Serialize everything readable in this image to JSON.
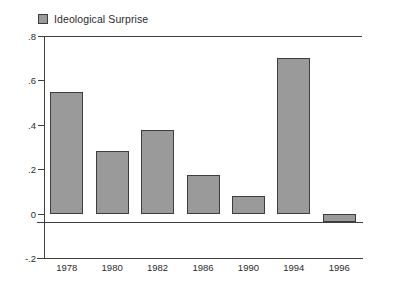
{
  "legend": {
    "swatch_name": "legend-swatch",
    "label": "Ideological Surprise",
    "color": "#9a9a9a",
    "border_color": "#3d3d3d"
  },
  "axes": {
    "y_ticks": [
      ".8",
      ".6",
      ".4",
      ".2",
      "0",
      "-.2"
    ],
    "y_tick_values": [
      0.8,
      0.6,
      0.4,
      0.2,
      0,
      -0.2
    ],
    "x_ticks": [
      "1978",
      "1980",
      "1982",
      "1986",
      "1990",
      "1994",
      "1996"
    ]
  },
  "chart_data": {
    "type": "bar",
    "title": "",
    "subtitle": "",
    "xlabel": "",
    "ylabel": "",
    "categories": [
      "1978",
      "1980",
      "1982",
      "1986",
      "1990",
      "1994",
      "1996"
    ],
    "values": [
      0.55,
      0.28,
      0.375,
      0.175,
      0.08,
      0.7,
      -0.04
    ],
    "series": [
      {
        "name": "Ideological Surprise",
        "values": [
          0.55,
          0.28,
          0.375,
          0.175,
          0.08,
          0.7,
          -0.04
        ],
        "color": "#9a9a9a"
      }
    ],
    "ylim": [
      -0.2,
      0.8
    ],
    "ytick_labels": [
      ".8",
      ".6",
      ".4",
      ".2",
      "0",
      "-.2"
    ],
    "ytick_values": [
      0.8,
      0.6,
      0.4,
      0.2,
      0,
      -0.2
    ],
    "grid": false,
    "legend_position": "top-left",
    "zero_line": true,
    "bar_edge_color": "#3d3d3d",
    "background": "#ffffff"
  }
}
